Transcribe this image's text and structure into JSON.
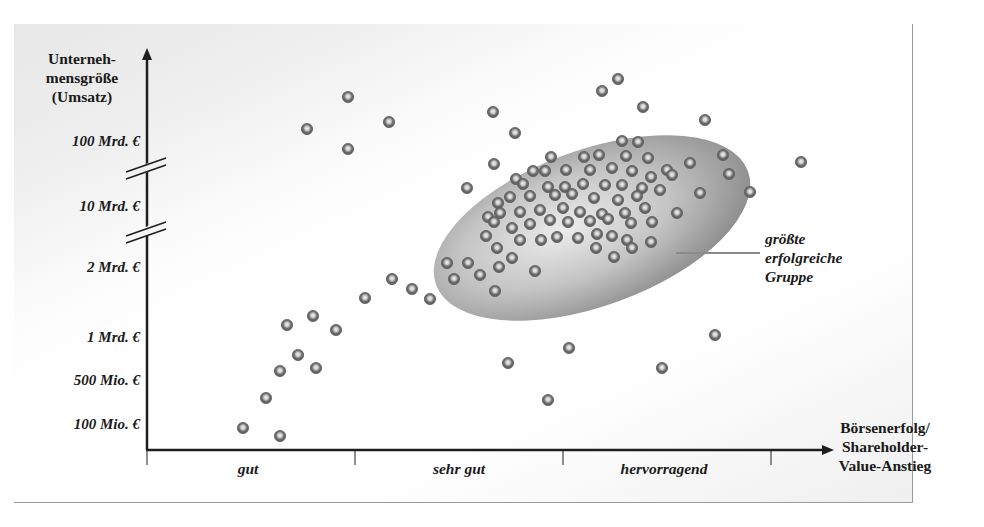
{
  "chart_data": {
    "type": "scatter",
    "title": "",
    "ylabel": "Unterneh-mensgröße (Umsatz)",
    "xlabel": "Börsenerfolg/ Shareholder-Value-Anstieg",
    "y_ticks": [
      "100 Mio. €",
      "500 Mio. €",
      "1 Mrd. €",
      "2 Mrd. €",
      "10 Mrd. €",
      "100 Mrd. €"
    ],
    "x_categories": [
      "gut",
      "sehr gut",
      "hervorragend"
    ],
    "axis_breaks": [
      "between 2 Mrd. € and 10 Mrd. €",
      "between 10 Mrd. € and 100 Mrd. €"
    ],
    "grid": false,
    "legend": null,
    "annotations": [
      {
        "text": "größte erfolgreiche Gruppe",
        "target": "shaded ellipse cluster",
        "position": "right of ellipse"
      }
    ],
    "highlight_region": {
      "shape": "ellipse",
      "x_range": [
        "sehr gut",
        "hervorragend"
      ],
      "y_range": [
        "2 Mrd. €",
        "100 Mrd. €"
      ],
      "color": "#9c9c9c"
    },
    "points_px_note": "points are given in image pixel coordinates (x, y); origin at axis corner (147, 450)",
    "points": [
      [
        243,
        428
      ],
      [
        280,
        436
      ],
      [
        266,
        398
      ],
      [
        280,
        371
      ],
      [
        298,
        355
      ],
      [
        287,
        325
      ],
      [
        313,
        316
      ],
      [
        316,
        368
      ],
      [
        336,
        330
      ],
      [
        307,
        129
      ],
      [
        348,
        97
      ],
      [
        348,
        149
      ],
      [
        389,
        122
      ],
      [
        365,
        298
      ],
      [
        392,
        279
      ],
      [
        412,
        289
      ],
      [
        430,
        299
      ],
      [
        467,
        188
      ],
      [
        493,
        112
      ],
      [
        515,
        133
      ],
      [
        602,
        91
      ],
      [
        618,
        79
      ],
      [
        643,
        107
      ],
      [
        705,
        120
      ],
      [
        801,
        162
      ],
      [
        750,
        192
      ],
      [
        508,
        363
      ],
      [
        569,
        348
      ],
      [
        548,
        400
      ],
      [
        662,
        368
      ],
      [
        715,
        335
      ],
      [
        494,
        164
      ],
      [
        551,
        157
      ],
      [
        584,
        157
      ],
      [
        599,
        155
      ],
      [
        622,
        141
      ],
      [
        638,
        142
      ],
      [
        626,
        156
      ],
      [
        648,
        158
      ],
      [
        667,
        170
      ],
      [
        690,
        163
      ],
      [
        723,
        155
      ],
      [
        729,
        174
      ],
      [
        533,
        171
      ],
      [
        516,
        179
      ],
      [
        545,
        171
      ],
      [
        566,
        170
      ],
      [
        590,
        170
      ],
      [
        612,
        168
      ],
      [
        632,
        171
      ],
      [
        651,
        177
      ],
      [
        672,
        175
      ],
      [
        700,
        193
      ],
      [
        523,
        184
      ],
      [
        548,
        187
      ],
      [
        565,
        187
      ],
      [
        583,
        184
      ],
      [
        605,
        185
      ],
      [
        622,
        185
      ],
      [
        642,
        188
      ],
      [
        660,
        190
      ],
      [
        498,
        203
      ],
      [
        510,
        197
      ],
      [
        530,
        196
      ],
      [
        555,
        195
      ],
      [
        572,
        194
      ],
      [
        594,
        198
      ],
      [
        618,
        200
      ],
      [
        637,
        196
      ],
      [
        677,
        213
      ],
      [
        488,
        217
      ],
      [
        500,
        213
      ],
      [
        520,
        212
      ],
      [
        540,
        210
      ],
      [
        563,
        208
      ],
      [
        580,
        212
      ],
      [
        602,
        214
      ],
      [
        625,
        213
      ],
      [
        645,
        208
      ],
      [
        486,
        236
      ],
      [
        494,
        222
      ],
      [
        512,
        228
      ],
      [
        530,
        224
      ],
      [
        550,
        220
      ],
      [
        568,
        222
      ],
      [
        590,
        221
      ],
      [
        608,
        219
      ],
      [
        631,
        223
      ],
      [
        652,
        222
      ],
      [
        497,
        248
      ],
      [
        520,
        240
      ],
      [
        541,
        240
      ],
      [
        557,
        237
      ],
      [
        578,
        238
      ],
      [
        597,
        234
      ],
      [
        612,
        236
      ],
      [
        627,
        240
      ],
      [
        651,
        242
      ],
      [
        447,
        263
      ],
      [
        468,
        263
      ],
      [
        480,
        275
      ],
      [
        499,
        267
      ],
      [
        512,
        258
      ],
      [
        535,
        271
      ],
      [
        596,
        248
      ],
      [
        614,
        257
      ],
      [
        632,
        248
      ],
      [
        454,
        279
      ],
      [
        495,
        291
      ]
    ]
  },
  "labels": {
    "y_title": "Unterneh-mensgröße (Umsatz)",
    "y_title_line1": "Unterneh-",
    "y_title_line2": "mensgröße",
    "y_title_line3": "(Umsatz)",
    "y_ticks": {
      "t100mrd": "100 Mrd. €",
      "t10mrd": "10 Mrd. €",
      "t2mrd": "2 Mrd. €",
      "t1mrd": "1 Mrd. €",
      "t500mio": "500 Mio. €",
      "t100mio": "100 Mio. €"
    },
    "x_categories": {
      "c1": "gut",
      "c2": "sehr gut",
      "c3": "hervorragend"
    },
    "x_title_line1": "Börsenerfolg/",
    "x_title_line2": "Shareholder-",
    "x_title_line3": "Value-Anstieg",
    "annotation_line1": "größte",
    "annotation_line2": "erfolgreiche",
    "annotation_line3": "Gruppe"
  },
  "colors": {
    "axis": "#1e1e1e",
    "dot_ring": "#6b6b6b",
    "dot_center": "#e8e8e8",
    "ellipse_dark": "#8e8e8e",
    "ellipse_light": "#e2e2e2",
    "leader_line": "#8a8a8a"
  }
}
